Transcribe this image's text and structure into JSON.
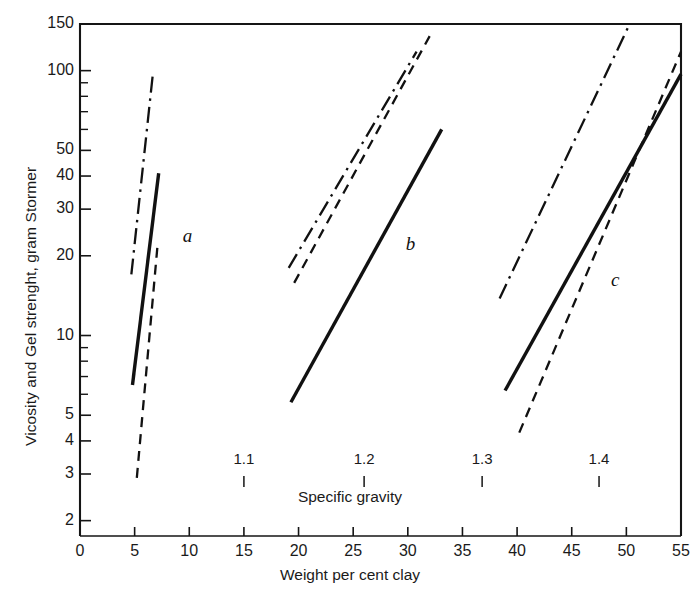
{
  "chart_data": {
    "type": "line",
    "title": "",
    "xlabel": "Weight per cent clay",
    "ylabel": "Vicosity and Gel strenght, gram Stormer",
    "secondary_xlabel": "Specific gravity",
    "yscale": "log",
    "ylim": [
      1.75,
      150
    ],
    "xlim": [
      0,
      55
    ],
    "grid": false,
    "legend": "none",
    "yticks": [
      150,
      100,
      50,
      40,
      30,
      20,
      10,
      5,
      4,
      3,
      2
    ],
    "ytick_labels": [
      "150",
      "100",
      "50",
      "40",
      "30",
      "20",
      "10",
      "5",
      "4",
      "3",
      "2"
    ],
    "yminor_ticks": [
      80,
      70,
      60,
      90,
      9,
      8,
      7,
      6
    ],
    "xticks": [
      0,
      5,
      10,
      15,
      20,
      25,
      30,
      35,
      40,
      45,
      50,
      55
    ],
    "xtick_labels": [
      "0",
      "5",
      "10",
      "15",
      "20",
      "25",
      "30",
      "35",
      "40",
      "45",
      "50",
      "55"
    ],
    "secondary_xticks": [
      15.0,
      26.0,
      36.8,
      47.5
    ],
    "secondary_xtick_labels": [
      "1.1",
      "1.2",
      "1.3",
      "1.4"
    ],
    "group_labels": [
      {
        "text": "a",
        "x": 9.4,
        "y": 23.5
      },
      {
        "text": "b",
        "x": 29.8,
        "y": 22.0
      },
      {
        "text": "c",
        "x": 48.6,
        "y": 16.0
      }
    ],
    "series": [
      {
        "name": "a-dash-dot",
        "style": "dashdot",
        "group": "a",
        "points": [
          [
            4.7,
            17.0
          ],
          [
            6.7,
            100.0
          ]
        ]
      },
      {
        "name": "a-solid",
        "style": "solid",
        "group": "a",
        "points": [
          [
            4.8,
            6.5
          ],
          [
            7.2,
            41.0
          ]
        ]
      },
      {
        "name": "a-dashed",
        "style": "dashed",
        "group": "a",
        "points": [
          [
            5.2,
            2.9
          ],
          [
            7.1,
            22.0
          ]
        ]
      },
      {
        "name": "b-dash-dot",
        "style": "dashdot",
        "group": "b",
        "points": [
          [
            19.1,
            18.0
          ],
          [
            30.8,
            118.0
          ]
        ]
      },
      {
        "name": "b-dashed",
        "style": "dashed",
        "group": "b",
        "points": [
          [
            19.6,
            15.8
          ],
          [
            32.0,
            135.0
          ]
        ]
      },
      {
        "name": "b-solid",
        "style": "solid",
        "group": "b",
        "points": [
          [
            19.3,
            5.6
          ],
          [
            33.1,
            60.0
          ]
        ]
      },
      {
        "name": "c-dash-dot",
        "style": "dashdot",
        "group": "c",
        "points": [
          [
            38.4,
            13.8
          ],
          [
            50.3,
            150.0
          ]
        ]
      },
      {
        "name": "c-solid",
        "style": "solid",
        "group": "c",
        "points": [
          [
            38.9,
            6.2
          ],
          [
            55.0,
            97.0
          ]
        ]
      },
      {
        "name": "c-dashed",
        "style": "dashed",
        "group": "c",
        "points": [
          [
            40.2,
            4.3
          ],
          [
            55.0,
            118.0
          ]
        ]
      }
    ]
  }
}
